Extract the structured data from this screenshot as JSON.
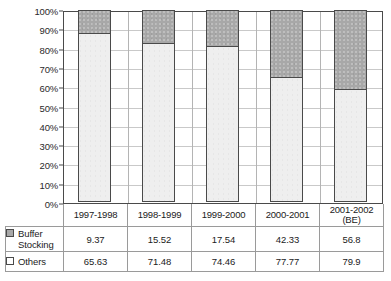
{
  "chart_data": {
    "type": "bar",
    "subtype": "stacked-100-percent",
    "title": "",
    "xlabel": "",
    "ylabel": "",
    "ylim": [
      0,
      100
    ],
    "grid": true,
    "legend_position": "bottom-table",
    "categories": [
      "1997-1998",
      "1998-1999",
      "1999-2000",
      "2000-2001",
      "2001-2002 (BE)"
    ],
    "category_lines": [
      [
        "1997-1998"
      ],
      [
        "1998-1999"
      ],
      [
        "1999-2000"
      ],
      [
        "2000-2001"
      ],
      [
        "2001-2002",
        "(BE)"
      ]
    ],
    "series": [
      {
        "name": "Buffer Stocking",
        "color": "#a8a8a8",
        "values": [
          9.37,
          15.52,
          17.54,
          42.33,
          56.8
        ],
        "display_values": [
          "9.37",
          "15.52",
          "17.54",
          "42.33",
          "56.8"
        ],
        "percent_of_total": [
          12.49,
          17.84,
          19.07,
          35.25,
          41.55
        ]
      },
      {
        "name": "Others",
        "color": "#efefef",
        "values": [
          65.63,
          71.48,
          74.46,
          77.77,
          79.9
        ],
        "display_values": [
          "65.63",
          "71.48",
          "74.46",
          "77.77",
          "79.9"
        ],
        "percent_of_total": [
          87.51,
          82.16,
          80.93,
          64.75,
          58.45
        ]
      }
    ],
    "ytick_labels": [
      "100%",
      "90%",
      "80%",
      "70%",
      "60%",
      "50%",
      "40%",
      "30%",
      "20%",
      "10%",
      "0%"
    ],
    "ytick_values": [
      100,
      90,
      80,
      70,
      60,
      50,
      40,
      30,
      20,
      10,
      0
    ]
  },
  "legend": {
    "items": [
      {
        "label_lines": [
          "Buffer",
          "Stocking"
        ],
        "label": "Buffer Stocking",
        "swatch": "filled-gray"
      },
      {
        "label_lines": [
          "Others"
        ],
        "label": "Others",
        "swatch": "empty-white"
      }
    ]
  }
}
